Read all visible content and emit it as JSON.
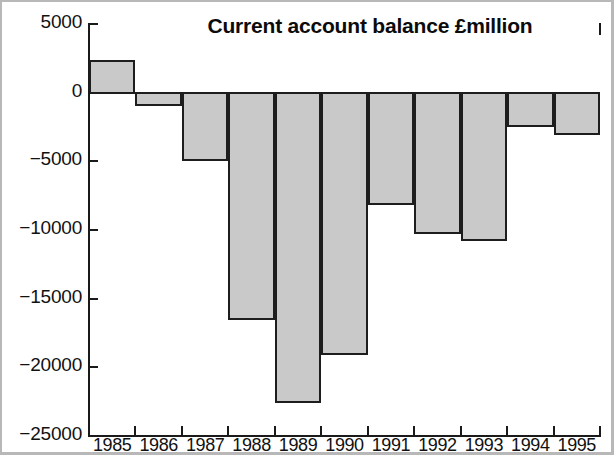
{
  "chart_data": {
    "type": "bar",
    "title": "Current account balance £million",
    "xlabel": "",
    "ylabel": "",
    "categories": [
      "1985",
      "1986",
      "1987",
      "1988",
      "1989",
      "1990",
      "1991",
      "1992",
      "1993",
      "1994",
      "1995"
    ],
    "values": [
      2300,
      -900,
      -4900,
      -16500,
      -22500,
      -19000,
      -8100,
      -10200,
      -10700,
      -2400,
      -3000
    ],
    "ylim": [
      -25000,
      5000
    ],
    "yticks": [
      5000,
      0,
      -5000,
      -10000,
      -15000,
      -20000,
      -25000
    ],
    "ytick_labels": [
      "5000",
      "0",
      "−5000",
      "−10000",
      "−15000",
      "−20000",
      "−25000"
    ],
    "grid": false,
    "legend": false,
    "bar_fill_color": "#c9c9c9",
    "bar_edge_color": "#1d1d1d",
    "background_color": "#ffffff",
    "units": "£million"
  }
}
